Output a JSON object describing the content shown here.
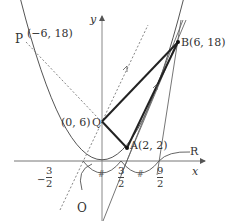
{
  "axes": {
    "x_label": "x",
    "y_label": "y"
  },
  "points": {
    "P": {
      "name": "P",
      "coord": "(−6, 18)"
    },
    "B": {
      "name": "B",
      "coord": "B(6, 18)"
    },
    "Q": {
      "name": "Q",
      "coord": "(0, 6)"
    },
    "A": {
      "name": "A",
      "coord": "A(2, 2)"
    },
    "R": {
      "name": "R"
    },
    "O": {
      "name": "O"
    }
  },
  "ticks": {
    "neg_three_halves": {
      "sign": "−",
      "num": "3",
      "den": "2"
    },
    "three_halves": {
      "num": "3",
      "den": "2"
    },
    "nine_halves": {
      "num": "9",
      "den": "2"
    }
  },
  "curve": {
    "equation": "y = x^2/2",
    "color": "#555555"
  },
  "colors": {
    "thick_line": "#222222",
    "thin_line": "#666666",
    "dashed": "#777777"
  }
}
